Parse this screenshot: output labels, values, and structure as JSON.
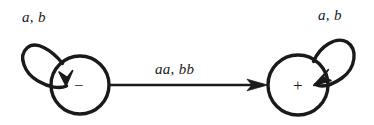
{
  "figure": {
    "kind": "finite-state-automaton-diagram",
    "background_color": "#ffffff",
    "stroke_color": "#1a1a1a",
    "text_color": "#1a1a1a"
  },
  "states": [
    {
      "id": "state-minus",
      "symbol": "−",
      "symbol_name": "minus",
      "cx": 80,
      "cy": 85,
      "r": 29
    },
    {
      "id": "state-plus",
      "symbol": "+",
      "symbol_name": "plus",
      "cx": 298,
      "cy": 85,
      "r": 30
    }
  ],
  "transitions": [
    {
      "id": "self-loop-minus",
      "label": "a, b",
      "from": "state-minus",
      "to": "state-minus",
      "label_x": 22,
      "label_y": 10
    },
    {
      "id": "transition-minus-to-plus",
      "label": "aa, bb",
      "from": "state-minus",
      "to": "state-plus",
      "label_x": 155,
      "label_y": 62
    },
    {
      "id": "self-loop-plus",
      "label": "a, b",
      "from": "state-plus",
      "to": "state-plus",
      "label_x": 318,
      "label_y": 8
    }
  ]
}
